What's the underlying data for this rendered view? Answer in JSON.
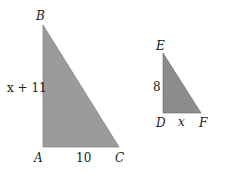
{
  "colors": {
    "triangle_large_fill": "#9a9a9a",
    "triangle_small_fill": "#8a8a8a",
    "text": "#1a1a1a"
  },
  "triangle_abc": {
    "vertices": {
      "A": "A",
      "B": "B",
      "C": "C"
    },
    "side_ab": "x + 11",
    "side_ac": "10"
  },
  "triangle_def": {
    "vertices": {
      "D": "D",
      "E": "E",
      "F": "F"
    },
    "side_de": "8",
    "side_df": "x"
  }
}
